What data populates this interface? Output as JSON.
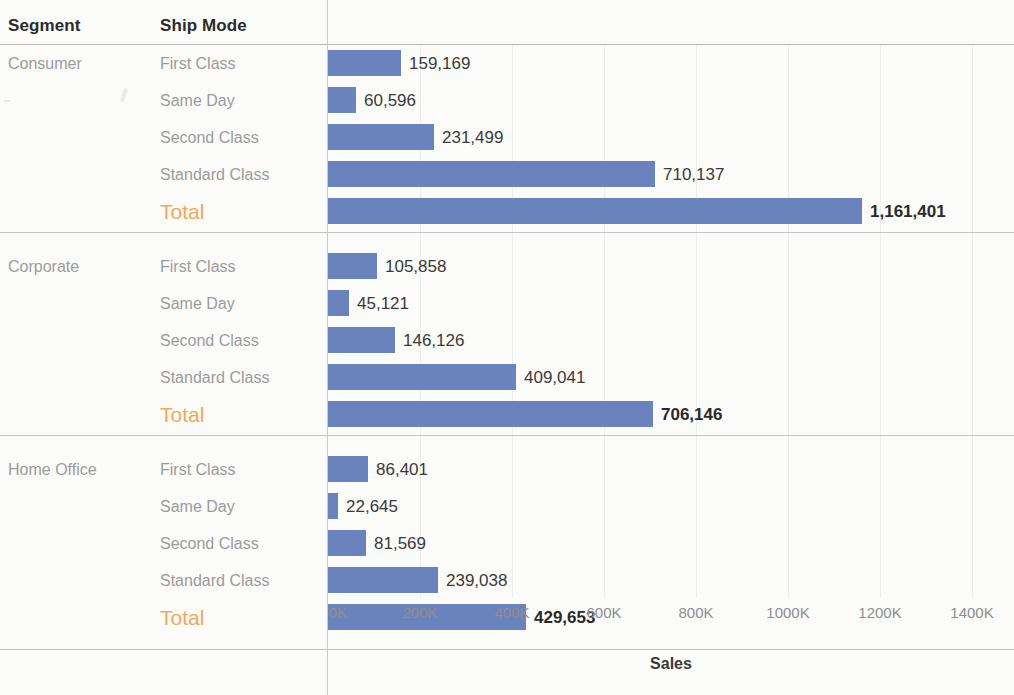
{
  "headers": {
    "segment": "Segment",
    "ship_mode": "Ship Mode"
  },
  "axis": {
    "title": "Sales",
    "ticks": [
      "0K",
      "200K",
      "400K",
      "600K",
      "800K",
      "1000K",
      "1200K",
      "1400K"
    ],
    "tick_values": [
      0,
      200000,
      400000,
      600000,
      800000,
      1000000,
      1200000,
      1400000
    ],
    "min": 0,
    "max": 1400000
  },
  "colors": {
    "bar": "#6b83bd",
    "total_label": "#f0a95c",
    "row_label": "#9b9b9b",
    "header_text": "#2b2b2b",
    "value_text": "#3a3a3a",
    "background": "#fbfbf9",
    "rule": "#c4c4c4",
    "gridline": "#ededed"
  },
  "chart_data": {
    "type": "bar",
    "title": "",
    "xlabel": "Sales",
    "ylabel": "",
    "orientation": "horizontal",
    "xlim": [
      0,
      1400000
    ],
    "grid": true,
    "legend": "none",
    "categories": [
      "Consumer - First Class",
      "Consumer - Same Day",
      "Consumer - Second Class",
      "Consumer - Standard Class",
      "Consumer - Total",
      "Corporate - First Class",
      "Corporate - Same Day",
      "Corporate - Second Class",
      "Corporate - Standard Class",
      "Corporate - Total",
      "Home Office - First Class",
      "Home Office - Same Day",
      "Home Office - Second Class",
      "Home Office - Standard Class",
      "Home Office - Total"
    ],
    "values": [
      159169,
      60596,
      231499,
      710137,
      1161401,
      105858,
      45121,
      146126,
      409041,
      706146,
      86401,
      22645,
      81569,
      239038,
      429653
    ],
    "groups": [
      {
        "segment": "Consumer",
        "rows": [
          {
            "ship_mode": "First Class",
            "value": 159169,
            "label": "159,169",
            "total": false
          },
          {
            "ship_mode": "Same Day",
            "value": 60596,
            "label": "60,596",
            "total": false
          },
          {
            "ship_mode": "Second Class",
            "value": 231499,
            "label": "231,499",
            "total": false
          },
          {
            "ship_mode": "Standard Class",
            "value": 710137,
            "label": "710,137",
            "total": false
          },
          {
            "ship_mode": "Total",
            "value": 1161401,
            "label": "1,161,401",
            "total": true
          }
        ]
      },
      {
        "segment": "Corporate",
        "rows": [
          {
            "ship_mode": "First Class",
            "value": 105858,
            "label": "105,858",
            "total": false
          },
          {
            "ship_mode": "Same Day",
            "value": 45121,
            "label": "45,121",
            "total": false
          },
          {
            "ship_mode": "Second Class",
            "value": 146126,
            "label": "146,126",
            "total": false
          },
          {
            "ship_mode": "Standard Class",
            "value": 409041,
            "label": "409,041",
            "total": false
          },
          {
            "ship_mode": "Total",
            "value": 706146,
            "label": "706,146",
            "total": true
          }
        ]
      },
      {
        "segment": "Home Office",
        "rows": [
          {
            "ship_mode": "First Class",
            "value": 86401,
            "label": "86,401",
            "total": false
          },
          {
            "ship_mode": "Same Day",
            "value": 22645,
            "label": "22,645",
            "total": false
          },
          {
            "ship_mode": "Second Class",
            "value": 81569,
            "label": "81,569",
            "total": false
          },
          {
            "ship_mode": "Standard Class",
            "value": 239038,
            "label": "239,038",
            "total": false
          },
          {
            "ship_mode": "Total",
            "value": 429653,
            "label": "429,653",
            "total": true
          }
        ]
      }
    ]
  }
}
